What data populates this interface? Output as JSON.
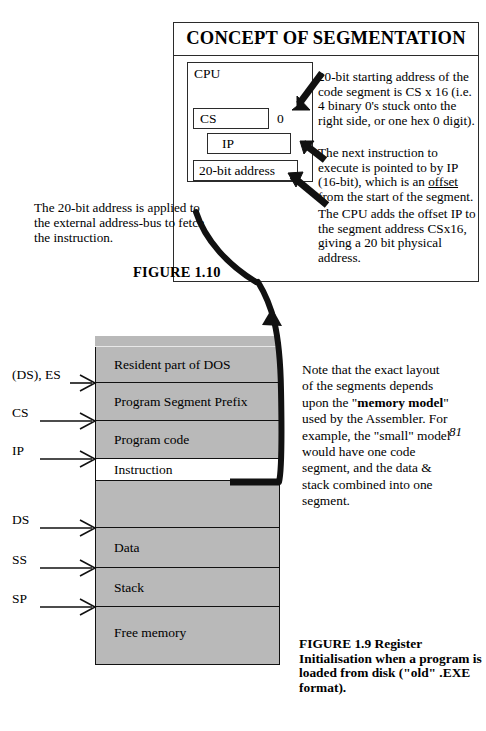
{
  "figure_top": {
    "title": "CONCEPT OF SEGMENTATION",
    "cpu_box_label": "CPU",
    "registers": [
      {
        "name": "cs-register",
        "label": "CS"
      },
      {
        "name": "ip-register",
        "label": "IP"
      },
      {
        "name": "address-register",
        "label": "20-bit address"
      }
    ],
    "cs_zero_suffix": "0",
    "notes": {
      "note_a": "20-bit starting address of the code segment is CS x 16  (i.e. 4 binary 0's stuck onto the right side, or one hex 0 digit).",
      "note_b_pre": "The next instruction to execute is pointed to by IP (16-bit), which is an ",
      "note_b_underline": "offset",
      "note_b_post": " from the start of the segment.",
      "note_c": "The CPU adds the offset IP to the segment address CSx16, giving a 20 bit physical address."
    },
    "note_left": "The 20-bit address is applied to the external address-bus to fetch the instruction.",
    "figure_label": "FIGURE 1.10"
  },
  "memory_map": {
    "segments": [
      {
        "label": "Resident part of DOS",
        "shaded": true
      },
      {
        "label": "Program Segment Prefix",
        "shaded": true
      },
      {
        "label": "Program code",
        "shaded": true
      },
      {
        "label": "Instruction",
        "shaded": false
      },
      {
        "label": "",
        "shaded": true
      },
      {
        "label": "Data",
        "shaded": true
      },
      {
        "label": "Stack",
        "shaded": true
      },
      {
        "label": "Free memory",
        "shaded": true
      }
    ],
    "pointers": [
      {
        "label": "(DS), ES"
      },
      {
        "label": "CS"
      },
      {
        "label": "IP"
      },
      {
        "label": "DS"
      },
      {
        "label": "SS"
      },
      {
        "label": "SP"
      }
    ]
  },
  "side_note": {
    "part1": "Note that the exact layout of the segments depends upon the \"",
    "bold1": "memory model",
    "part2": "\" used by the Assembler.  For example, the \"small\" model would have one code segment, and the data & stack combined into one segment."
  },
  "page_number": "81",
  "figure_caption": "FIGURE  1.9  Register Initialisation when a program is loaded from disk (\"old\" .EXE format).",
  "colors": {
    "ink": "#000000",
    "segment_fill": "#b9b9b9",
    "paper": "#ffffff"
  }
}
